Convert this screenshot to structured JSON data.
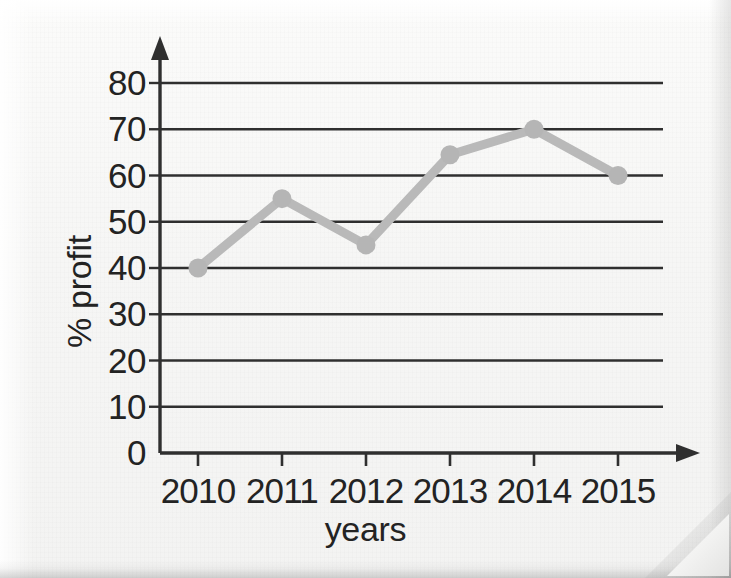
{
  "page": {
    "background_color": "#f5f5f4",
    "ink_color": "#232323"
  },
  "chart_data": {
    "type": "line",
    "title": "",
    "xlabel": "years",
    "ylabel": "% profit",
    "categories": [
      "2010",
      "2011",
      "2012",
      "2013",
      "2014",
      "2015"
    ],
    "values": [
      40,
      55,
      45,
      64.5,
      70,
      60
    ],
    "series": [
      {
        "name": "% profit",
        "values": [
          40,
          55,
          45,
          64.5,
          70,
          60
        ],
        "line_color": "#b9b9b9",
        "marker_color": "#b5b5b5",
        "marker_shape": "circle"
      }
    ],
    "ylim": [
      0,
      80
    ],
    "y_ticks": [
      "0",
      "10",
      "20",
      "30",
      "40",
      "50",
      "60",
      "70",
      "80"
    ],
    "y_tick_values": [
      0,
      10,
      20,
      30,
      40,
      50,
      60,
      70,
      80
    ],
    "x_ticks": [
      "2010",
      "2011",
      "2012",
      "2013",
      "2014",
      "2015"
    ],
    "grid": "horizontal",
    "grid_color": "#2f2f2f",
    "legend": "none",
    "axis_arrows": true,
    "annotations": []
  }
}
